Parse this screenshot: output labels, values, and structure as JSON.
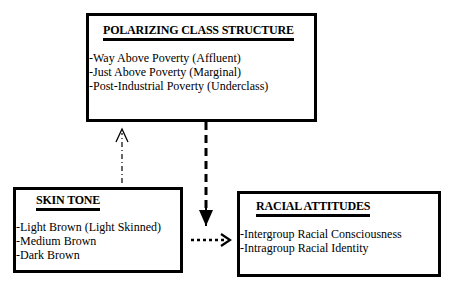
{
  "boxes": {
    "class_structure": {
      "title": "POLARIZING CLASS STRUCTURE",
      "items": [
        "-Way Above Poverty (Affluent)",
        "-Just Above Poverty (Marginal)",
        "-Post-Industrial Poverty (Underclass)"
      ]
    },
    "skin_tone": {
      "title": "SKIN TONE",
      "items": [
        "-Light Brown (Light Skinned)",
        "-Medium Brown",
        "-Dark Brown"
      ]
    },
    "racial_attitudes": {
      "title": "RACIAL ATTITUDES",
      "items": [
        "-Intergroup Racial Consciousness",
        "-Intragroup Racial Identity"
      ]
    }
  },
  "arrows": [
    {
      "from": "skin_tone",
      "to": "class_structure",
      "style": "thin dash-dot"
    },
    {
      "from": "class_structure",
      "to": "racial_attitudes",
      "style": "thick dashed"
    },
    {
      "from": "skin_tone",
      "to": "racial_attitudes",
      "style": "dotted"
    }
  ]
}
